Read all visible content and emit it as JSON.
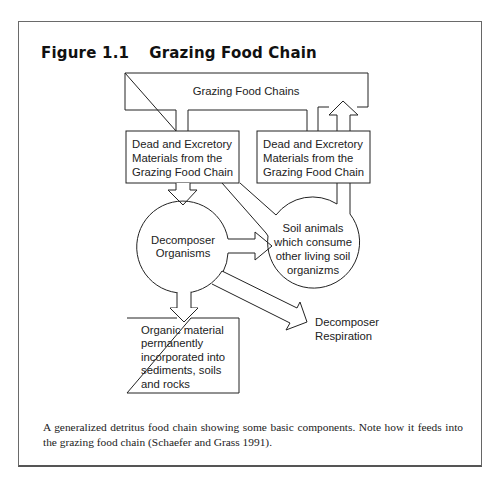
{
  "figure": {
    "number": "Figure 1.1",
    "title": "Grazing Food Chain"
  },
  "diagram": {
    "nodes": {
      "grazing_food_chains": {
        "label": "Grazing Food Chains",
        "shape": "bracket-box"
      },
      "dead_excretory_left": {
        "shape": "box",
        "lines": [
          "Dead and Excretory",
          "Materials from the",
          "Grazing Food Chain"
        ]
      },
      "dead_excretory_right": {
        "shape": "box",
        "lines": [
          "Dead and Excretory",
          "Materials from the",
          "Grazing Food Chain"
        ]
      },
      "decomposer_organisms": {
        "shape": "circle",
        "lines": [
          "Decomposer",
          "Organisms"
        ]
      },
      "soil_animals": {
        "shape": "circle",
        "lines": [
          "Soil animals",
          "which consume",
          "other living soil",
          "organizms"
        ]
      },
      "organic_material": {
        "shape": "box",
        "lines": [
          "Organic material",
          "permanently",
          "incorporated into",
          "sediments, soils",
          "and rocks"
        ]
      },
      "decomposer_respiration": {
        "shape": "label",
        "lines": [
          "Decomposer",
          "Respiration"
        ]
      }
    },
    "edges": [
      {
        "from": "grazing_food_chains",
        "to": "dead_excretory_left",
        "type": "channel"
      },
      {
        "from": "grazing_food_chains",
        "to": "dead_excretory_right",
        "type": "channel"
      },
      {
        "from": "dead_excretory_right",
        "to": "grazing_food_chains",
        "type": "arrow-up"
      },
      {
        "from": "dead_excretory_left",
        "to": "decomposer_organisms",
        "type": "arrow-down"
      },
      {
        "from": "dead_excretory_left",
        "to": "soil_animals",
        "type": "channel"
      },
      {
        "from": "dead_excretory_right",
        "to": "soil_animals",
        "type": "channel"
      },
      {
        "from": "decomposer_organisms",
        "to": "soil_animals",
        "type": "arrow-right"
      },
      {
        "from": "decomposer_organisms",
        "to": "organic_material",
        "type": "arrow-down"
      },
      {
        "from": "decomposer_organisms",
        "to": "decomposer_respiration",
        "type": "arrow-diagonal"
      }
    ]
  },
  "caption": {
    "line1": "A generalized detritus food chain showing some basic components. Note how it feeds into",
    "line2": "the grazing food chain (Schaefer and Grass 1991)."
  },
  "colors": {
    "stroke": "#222222",
    "text": "#222222",
    "frame": "#666666"
  }
}
